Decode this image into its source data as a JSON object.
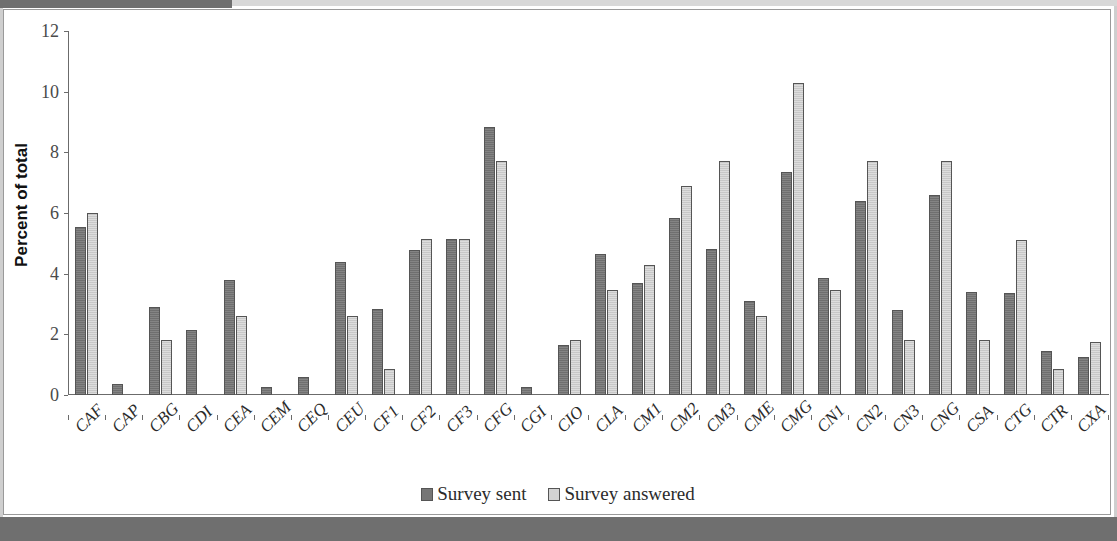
{
  "chart_data": {
    "type": "bar",
    "title": "",
    "xlabel": "",
    "ylabel": "Percent of total",
    "ylim": [
      0,
      12
    ],
    "yticks": [
      0,
      2,
      4,
      6,
      8,
      10,
      12
    ],
    "grid": false,
    "legend_position": "bottom",
    "categories": [
      "CAF",
      "CAP",
      "CBG",
      "CDI",
      "CEA",
      "CEM",
      "CEQ",
      "CEU",
      "CF1",
      "CF2",
      "CF3",
      "CFG",
      "CGI",
      "CIO",
      "CLA",
      "CM1",
      "CM2",
      "CM3",
      "CME",
      "CMG",
      "CN1",
      "CN2",
      "CN3",
      "CNG",
      "CSA",
      "CTG",
      "CTR",
      "CXA"
    ],
    "series": [
      {
        "name": "Survey sent",
        "color": "#767676",
        "values": [
          5.55,
          0.35,
          2.9,
          2.15,
          3.78,
          0.25,
          0.6,
          4.4,
          2.85,
          4.78,
          5.15,
          8.85,
          0.25,
          1.65,
          4.65,
          3.7,
          5.85,
          4.8,
          3.1,
          7.35,
          3.85,
          6.4,
          2.8,
          6.6,
          3.4,
          3.35,
          1.45,
          1.25
        ]
      },
      {
        "name": "Survey answered",
        "color": "#d2d2d2",
        "values": [
          6.0,
          0,
          1.8,
          0,
          2.6,
          0,
          0,
          2.6,
          0.85,
          5.15,
          5.15,
          7.7,
          0,
          1.8,
          3.45,
          4.3,
          6.9,
          7.7,
          2.6,
          10.3,
          3.45,
          7.7,
          1.8,
          7.7,
          1.8,
          5.1,
          0.85,
          1.75
        ]
      }
    ]
  },
  "legend": {
    "items": [
      {
        "label": "Survey sent",
        "key": "sent"
      },
      {
        "label": "Survey answered",
        "key": "answered"
      }
    ]
  },
  "axis": {
    "y_title": "Percent of total"
  }
}
